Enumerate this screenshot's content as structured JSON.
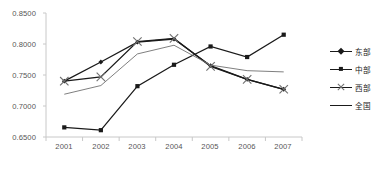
{
  "chart_data": {
    "type": "line",
    "title": "",
    "xlabel": "",
    "ylabel": "",
    "categories": [
      "2001",
      "2002",
      "2003",
      "2004",
      "2005",
      "2006",
      "2007"
    ],
    "ylim": [
      0.65,
      0.85
    ],
    "ytick_labels": [
      "0.8500",
      "0.8000",
      "0.7500",
      "0.7000",
      "0.6500"
    ],
    "yticks": [
      0.85,
      0.8,
      0.75,
      0.7,
      0.65
    ],
    "grid": false,
    "legend_position": "right",
    "series": [
      {
        "name": "东部",
        "marker": "diamond",
        "values": [
          0.74,
          0.771,
          0.803,
          0.808,
          0.765,
          0.743,
          0.727
        ]
      },
      {
        "name": "中部",
        "marker": "square",
        "values": [
          0.6655,
          0.661,
          0.732,
          0.7665,
          0.796,
          0.779,
          0.815
        ]
      },
      {
        "name": "西部",
        "marker": "cross",
        "values": [
          0.74,
          0.747,
          0.804,
          0.809,
          0.764,
          0.743,
          0.727
        ]
      },
      {
        "name": "全国",
        "marker": "none",
        "values": [
          0.719,
          0.733,
          0.784,
          0.798,
          0.766,
          0.757,
          0.755
        ]
      }
    ]
  },
  "colors": {
    "line": "#1a1a1a",
    "axis": "#c8c8c8",
    "tick_text": "#555555",
    "legend_text": "#222222",
    "cross_marker": "#6f6f6f",
    "background": "#ffffff"
  },
  "legend": {
    "items": [
      {
        "label": "东部",
        "marker": "diamond"
      },
      {
        "label": "中部",
        "marker": "square"
      },
      {
        "label": "西部",
        "marker": "cross"
      },
      {
        "label": "全国",
        "marker": "none"
      }
    ]
  }
}
